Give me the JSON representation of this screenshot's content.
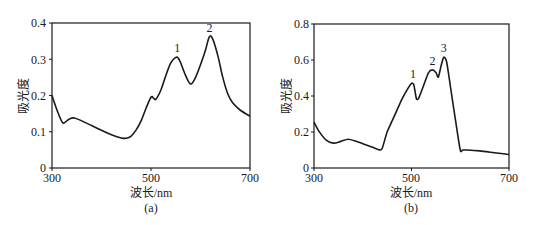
{
  "chart_data": [
    {
      "type": "line",
      "caption": "(a)",
      "xlabel": "波长/nm",
      "ylabel": "吸光度",
      "xlim": [
        300,
        700
      ],
      "ylim": [
        0,
        0.4
      ],
      "xticks": [
        300,
        500,
        700
      ],
      "yticks": [
        0,
        0.1,
        0.2,
        0.3,
        0.4
      ],
      "ytick_labels": [
        "0",
        "0.1",
        "0.2",
        "0.3",
        "0.4"
      ],
      "grid": false,
      "annotations": [
        {
          "text": "1",
          "x": 553,
          "y": 0.305
        },
        {
          "text": "2",
          "x": 618,
          "y": 0.362
        }
      ],
      "series": [
        {
          "name": "spectrum-a",
          "x": [
            300,
            310,
            320,
            325,
            335,
            345,
            360,
            380,
            400,
            420,
            440,
            450,
            460,
            470,
            480,
            490,
            500,
            505,
            510,
            520,
            530,
            540,
            550,
            555,
            560,
            570,
            580,
            590,
            600,
            610,
            618,
            625,
            635,
            645,
            655,
            665,
            680,
            700
          ],
          "y": [
            0.2,
            0.16,
            0.128,
            0.125,
            0.135,
            0.138,
            0.13,
            0.117,
            0.104,
            0.092,
            0.083,
            0.082,
            0.088,
            0.105,
            0.13,
            0.165,
            0.195,
            0.193,
            0.19,
            0.215,
            0.255,
            0.29,
            0.305,
            0.303,
            0.29,
            0.255,
            0.232,
            0.25,
            0.285,
            0.325,
            0.362,
            0.355,
            0.31,
            0.25,
            0.205,
            0.18,
            0.16,
            0.143
          ]
        }
      ]
    },
    {
      "type": "line",
      "caption": "(b)",
      "xlabel": "波长/nm",
      "ylabel": "吸光度",
      "xlim": [
        300,
        700
      ],
      "ylim": [
        0,
        0.8
      ],
      "xticks": [
        300,
        500,
        700
      ],
      "yticks": [
        0,
        0.2,
        0.4,
        0.6,
        0.8
      ],
      "ytick_labels": [
        "0",
        "0.2",
        "0.4",
        "0.6",
        "0.8"
      ],
      "grid": false,
      "annotations": [
        {
          "text": "1",
          "x": 503,
          "y": 0.47
        },
        {
          "text": "2",
          "x": 543,
          "y": 0.545
        },
        {
          "text": "3",
          "x": 566,
          "y": 0.615
        }
      ],
      "series": [
        {
          "name": "spectrum-b",
          "x": [
            300,
            310,
            325,
            340,
            355,
            370,
            385,
            400,
            420,
            435,
            440,
            450,
            460,
            470,
            480,
            490,
            500,
            505,
            510,
            515,
            525,
            535,
            543,
            550,
            555,
            560,
            566,
            572,
            580,
            590,
            600,
            605,
            615,
            640,
            670,
            700
          ],
          "y": [
            0.255,
            0.205,
            0.155,
            0.138,
            0.148,
            0.16,
            0.15,
            0.135,
            0.115,
            0.1,
            0.11,
            0.2,
            0.26,
            0.32,
            0.38,
            0.43,
            0.47,
            0.46,
            0.385,
            0.39,
            0.46,
            0.53,
            0.545,
            0.53,
            0.505,
            0.56,
            0.615,
            0.59,
            0.45,
            0.27,
            0.1,
            0.1,
            0.1,
            0.095,
            0.085,
            0.075
          ]
        }
      ]
    }
  ],
  "figure": {
    "panel_a": {
      "caption": "(a)",
      "xlabel": "波长/nm",
      "ylabel": "吸光度",
      "xtick_labels": [
        "300",
        "500",
        "700"
      ],
      "ytick_labels": [
        "0",
        "0.1",
        "0.2",
        "0.3",
        "0.4"
      ],
      "peak_labels": [
        "1",
        "2"
      ]
    },
    "panel_b": {
      "caption": "(b)",
      "xlabel": "波长/nm",
      "ylabel": "吸光度",
      "xtick_labels": [
        "300",
        "500",
        "700"
      ],
      "ytick_labels": [
        "0",
        "0.2",
        "0.4",
        "0.6",
        "0.8"
      ],
      "peak_labels": [
        "1",
        "2",
        "3"
      ]
    },
    "colors": {
      "line": "#1a1a1a",
      "axis": "#1a1a1a",
      "background": "#ffffff"
    }
  }
}
